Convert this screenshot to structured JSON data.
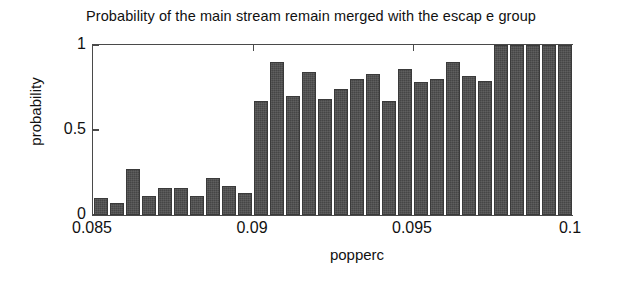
{
  "chart_data": {
    "type": "bar",
    "title": "Probability of the main stream remain merged with the escap e group",
    "xlabel": "popperc",
    "ylabel": "probability",
    "xlim": [
      0.085,
      0.1
    ],
    "ylim": [
      0,
      1
    ],
    "grid": false,
    "legend": null,
    "xticks": [
      0.085,
      0.09,
      0.095,
      0.1
    ],
    "xtick_labels": [
      "0.085",
      "0.09",
      "0.095",
      "0.1"
    ],
    "yticks": [
      0,
      0.5,
      1
    ],
    "ytick_labels": [
      "0",
      "0.5",
      "1"
    ],
    "bar_color": "#4d4d4d",
    "n_bars": 30,
    "bin_width": 0.0005,
    "x": [
      0.08525,
      0.08575,
      0.08625,
      0.08675,
      0.08725,
      0.08775,
      0.08825,
      0.08875,
      0.08925,
      0.08975,
      0.09025,
      0.09075,
      0.09125,
      0.09175,
      0.09225,
      0.09275,
      0.09325,
      0.09375,
      0.09425,
      0.09475,
      0.09525,
      0.09575,
      0.09625,
      0.09675,
      0.09725,
      0.09775,
      0.09825,
      0.09875,
      0.09925,
      0.09975
    ],
    "values": [
      0.1,
      0.07,
      0.27,
      0.11,
      0.16,
      0.16,
      0.11,
      0.22,
      0.17,
      0.13,
      0.67,
      0.9,
      0.7,
      0.84,
      0.68,
      0.74,
      0.8,
      0.83,
      0.67,
      0.86,
      0.78,
      0.8,
      0.9,
      0.82,
      0.79,
      1.0,
      1.0,
      1.0,
      1.0,
      1.0
    ]
  }
}
